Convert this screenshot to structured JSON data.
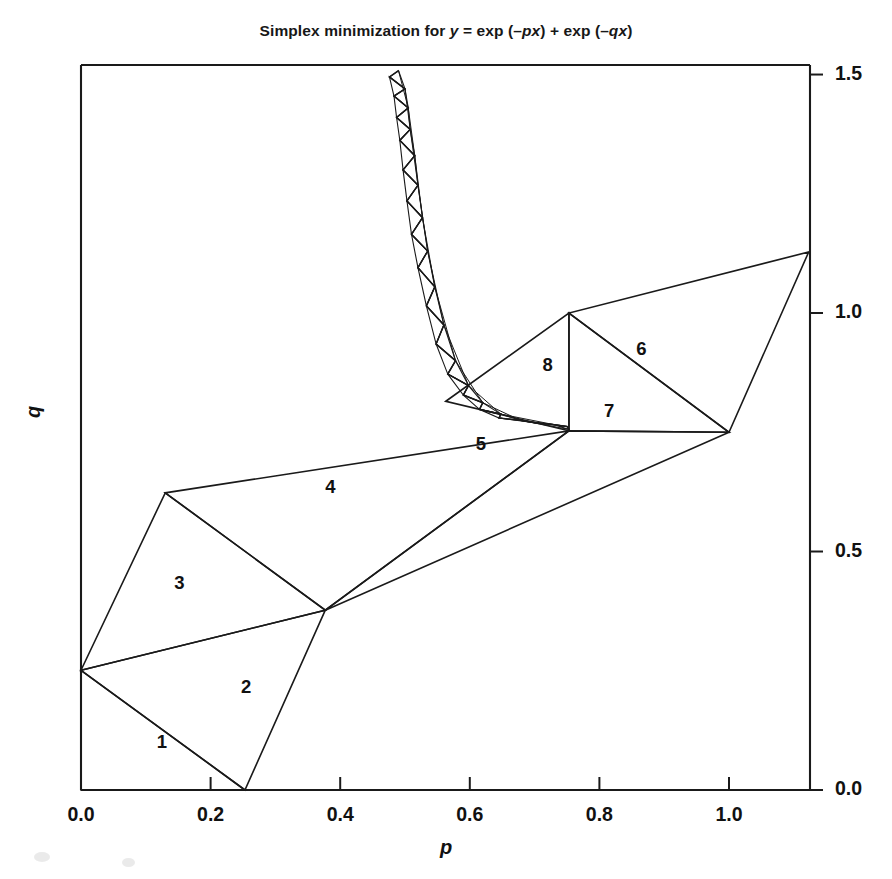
{
  "figure": {
    "title_prefix": "Simplex minimization for ",
    "title_y": "y",
    "title_eq1": " = exp (–",
    "title_px": "px",
    "title_eq2": ") + exp (–",
    "title_qx": "qx",
    "title_eq3": ")",
    "title_full": "Simplex minimization for y = exp (–px) + exp (–qx)",
    "xlabel": "p",
    "ylabel": "q",
    "line_color": "#1a1a1a",
    "background": "#ffffff"
  },
  "chart_data": {
    "type": "line",
    "title": "Simplex minimization for y = exp (–px) + exp (–qx)",
    "xlabel": "p",
    "ylabel": "q",
    "xlim": [
      0.0,
      1.125
    ],
    "ylim": [
      0.0,
      1.52
    ],
    "xticks": [
      0.0,
      0.2,
      0.4,
      0.6,
      0.8,
      1.0
    ],
    "xticklabels": [
      "0.0",
      "0.2",
      "0.4",
      "0.6",
      "0.8",
      "1.0"
    ],
    "yticks": [
      0.0,
      0.5,
      1.0,
      1.5
    ],
    "yticklabels": [
      "0.0",
      "0.5",
      "1.0",
      "1.5"
    ],
    "grid": false,
    "legend": null,
    "y_axis_side": "right",
    "x_axis_side": "bottom",
    "annotations": [
      {
        "label": "1",
        "p": 0.125,
        "q": 0.1
      },
      {
        "label": "2",
        "p": 0.255,
        "q": 0.215
      },
      {
        "label": "3",
        "p": 0.152,
        "q": 0.435
      },
      {
        "label": "4",
        "p": 0.385,
        "q": 0.635
      },
      {
        "label": "5",
        "p": 0.617,
        "q": 0.725
      },
      {
        "label": "6",
        "p": 0.865,
        "q": 0.925
      },
      {
        "label": "7",
        "p": 0.815,
        "q": 0.795
      },
      {
        "label": "8",
        "p": 0.72,
        "q": 0.89
      }
    ],
    "simplices": [
      {
        "n": 1,
        "vertices": [
          [
            0.0,
            0.251
          ],
          [
            0.253,
            0.0
          ],
          [
            0.0,
            0.0
          ]
        ]
      },
      {
        "n": 2,
        "vertices": [
          [
            0.0,
            0.251
          ],
          [
            0.253,
            0.0
          ],
          [
            0.377,
            0.377
          ]
        ]
      },
      {
        "n": 3,
        "vertices": [
          [
            0.0,
            0.251
          ],
          [
            0.377,
            0.377
          ],
          [
            0.13,
            0.623
          ]
        ]
      },
      {
        "n": 4,
        "vertices": [
          [
            0.13,
            0.623
          ],
          [
            0.377,
            0.377
          ],
          [
            0.753,
            0.753
          ]
        ]
      },
      {
        "n": 5,
        "vertices": [
          [
            0.377,
            0.377
          ],
          [
            0.753,
            0.753
          ],
          [
            1.0,
            0.75
          ]
        ]
      },
      {
        "n": 6,
        "vertices": [
          [
            0.753,
            1.0
          ],
          [
            1.0,
            0.75
          ],
          [
            1.123,
            1.128
          ]
        ]
      },
      {
        "n": 7,
        "vertices": [
          [
            0.753,
            0.753
          ],
          [
            1.0,
            0.75
          ],
          [
            0.753,
            1.0
          ]
        ]
      },
      {
        "n": 8,
        "vertices": [
          [
            0.563,
            0.815
          ],
          [
            0.753,
            1.0
          ],
          [
            0.753,
            0.753
          ]
        ]
      }
    ],
    "converging_trail": [
      [
        0.49,
        1.508
      ],
      [
        0.476,
        1.495
      ],
      [
        0.5,
        1.47
      ],
      [
        0.483,
        1.455
      ],
      [
        0.505,
        1.43
      ],
      [
        0.487,
        1.41
      ],
      [
        0.508,
        1.385
      ],
      [
        0.492,
        1.362
      ],
      [
        0.515,
        1.33
      ],
      [
        0.497,
        1.3
      ],
      [
        0.52,
        1.268
      ],
      [
        0.503,
        1.235
      ],
      [
        0.527,
        1.2
      ],
      [
        0.51,
        1.165
      ],
      [
        0.535,
        1.13
      ],
      [
        0.52,
        1.095
      ],
      [
        0.546,
        1.055
      ],
      [
        0.533,
        1.015
      ],
      [
        0.56,
        0.975
      ],
      [
        0.548,
        0.935
      ],
      [
        0.578,
        0.9
      ],
      [
        0.566,
        0.872
      ],
      [
        0.598,
        0.848
      ],
      [
        0.59,
        0.828
      ],
      [
        0.62,
        0.812
      ],
      [
        0.615,
        0.798
      ],
      [
        0.648,
        0.788
      ],
      [
        0.645,
        0.78
      ],
      [
        0.678,
        0.775
      ],
      [
        0.7,
        0.77
      ],
      [
        0.73,
        0.766
      ],
      [
        0.75,
        0.762
      ],
      [
        0.753,
        0.756
      ]
    ]
  }
}
